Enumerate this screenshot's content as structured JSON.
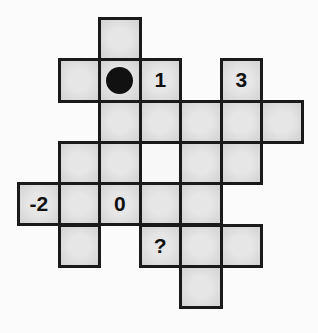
{
  "puzzle": {
    "grid": {
      "origin_x": 17,
      "origin_y": 17,
      "cell_w": 40.5,
      "cell_h": 41.3,
      "colors": {
        "cell": "#dcdcdc",
        "white_cell": "#f8f8f8",
        "border": "#1a1a1a",
        "dot": "#111111"
      }
    },
    "cells": [
      {
        "row": 0,
        "col": 2,
        "label": ""
      },
      {
        "row": 1,
        "col": 1,
        "label": ""
      },
      {
        "row": 1,
        "col": 2,
        "label": "",
        "marker": "dot"
      },
      {
        "row": 1,
        "col": 3,
        "label": "1"
      },
      {
        "row": 1,
        "col": 5,
        "label": "3"
      },
      {
        "row": 2,
        "col": 2,
        "label": ""
      },
      {
        "row": 2,
        "col": 3,
        "label": ""
      },
      {
        "row": 2,
        "col": 4,
        "label": ""
      },
      {
        "row": 2,
        "col": 5,
        "label": ""
      },
      {
        "row": 2,
        "col": 6,
        "label": ""
      },
      {
        "row": 3,
        "col": 1,
        "label": ""
      },
      {
        "row": 3,
        "col": 2,
        "label": ""
      },
      {
        "row": 3,
        "col": 3,
        "label": "",
        "style": "white"
      },
      {
        "row": 3,
        "col": 4,
        "label": ""
      },
      {
        "row": 3,
        "col": 5,
        "label": ""
      },
      {
        "row": 4,
        "col": 0,
        "label": "-2"
      },
      {
        "row": 4,
        "col": 1,
        "label": ""
      },
      {
        "row": 4,
        "col": 2,
        "label": "0"
      },
      {
        "row": 4,
        "col": 3,
        "label": ""
      },
      {
        "row": 4,
        "col": 4,
        "label": ""
      },
      {
        "row": 5,
        "col": 1,
        "label": ""
      },
      {
        "row": 5,
        "col": 3,
        "label": "?"
      },
      {
        "row": 5,
        "col": 4,
        "label": ""
      },
      {
        "row": 5,
        "col": 5,
        "label": ""
      },
      {
        "row": 6,
        "col": 4,
        "label": ""
      }
    ]
  }
}
